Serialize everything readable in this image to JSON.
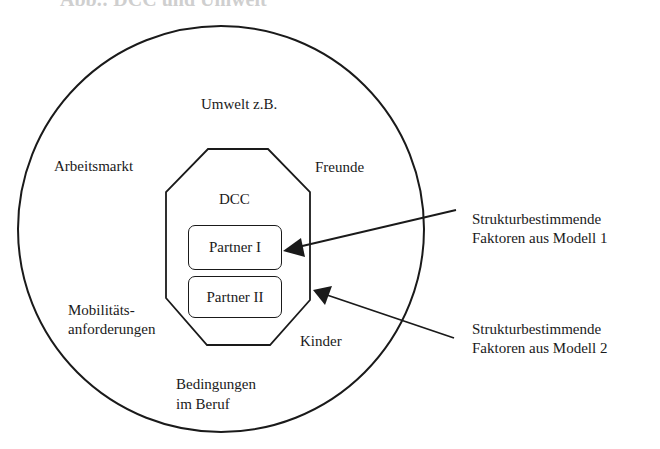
{
  "figure": {
    "title_clipped": "Abb.: DCC und Umwelt",
    "outer_circle": {
      "label": "Umwelt z.B.",
      "factors": [
        "Arbeitsmarkt",
        "Freunde",
        "Mobilitäts-",
        "anforderungen",
        "Kinder",
        "Bedingungen",
        "im Beruf"
      ]
    },
    "octagon": {
      "label": "DCC",
      "partners": [
        "Partner I",
        "Partner II"
      ]
    },
    "annotations": [
      {
        "line1": "Strukturbestimmende",
        "line2": "Faktoren aus Modell 1",
        "points_to": "Partner I"
      },
      {
        "line1": "Strukturbestimmende",
        "line2": "Faktoren aus Modell 2",
        "points_to": "DCC"
      }
    ],
    "colors": {
      "stroke": "#1a1a1a",
      "background": "#ffffff"
    }
  }
}
